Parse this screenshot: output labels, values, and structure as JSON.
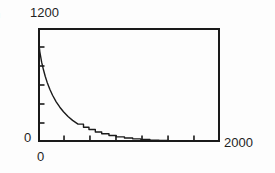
{
  "figure": {
    "panel_label": ")",
    "background_color": "#fdfdfd",
    "ink_color": "#1a1a1a"
  },
  "axes": {
    "y_max_label": "1200",
    "y_min_label": "0",
    "x_min_label": "0",
    "x_max_label": "2000",
    "frame_color": "#1a1a1a",
    "frame_width_px": 2,
    "y_tick_count": 6,
    "x_tick_count": 7
  },
  "chart_data": {
    "type": "line",
    "title": "",
    "xlabel": "",
    "ylabel": "",
    "xlim": [
      0,
      2000
    ],
    "ylim": [
      0,
      1200
    ],
    "grid": false,
    "legend": null,
    "annotations": [],
    "xticks": [
      0,
      286,
      571,
      857,
      1143,
      1429,
      1714,
      2000
    ],
    "yticks": [
      0,
      200,
      400,
      600,
      800,
      1000,
      1200
    ],
    "xtick_labels": [
      "0",
      "",
      "",
      "",
      "",
      "",
      "",
      "2000"
    ],
    "ytick_labels": [
      "0",
      "",
      "",
      "",
      "",
      "",
      "1200"
    ],
    "series": [
      {
        "name": "decay",
        "style": "stepped-line",
        "color": "#1a1a1a",
        "x": [
          0,
          10,
          20,
          40,
          60,
          80,
          100,
          130,
          160,
          200,
          240,
          280,
          330,
          380,
          440,
          500,
          560,
          630,
          700,
          780,
          860,
          950,
          1040,
          1130,
          1230,
          1330,
          1430,
          1540,
          1650,
          1760,
          1880,
          2000
        ],
        "y": [
          1180,
          1040,
          950,
          840,
          760,
          690,
          630,
          555,
          492,
          423,
          366,
          318,
          268,
          228,
          188,
          156,
          131,
          106,
          87,
          68,
          54,
          42,
          33,
          26,
          20,
          16,
          13,
          10,
          8,
          6,
          5,
          4
        ]
      }
    ]
  }
}
